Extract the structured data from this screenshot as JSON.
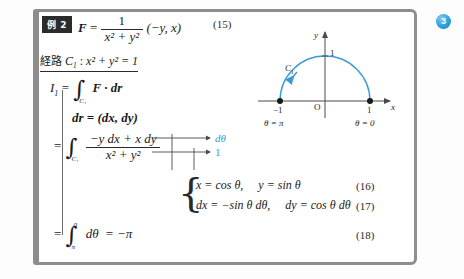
{
  "page": {
    "badge_number": "3",
    "accent_blue": "#2f9fe0",
    "frame_color": "#8d8d8d"
  },
  "example": {
    "badge_label": "例 2",
    "field_lhs": "F",
    "field_eq": "=",
    "field_frac_num": "1",
    "field_frac_den": "x² + y²",
    "field_vector": "(−y, x)",
    "eqnum": "(15)"
  },
  "path": {
    "label": "経路",
    "curve_name": "C",
    "curve_sub": "1",
    "colon": ":",
    "equation": "x² + y² = 1"
  },
  "derivation": {
    "lhs": "I",
    "lhs_sub": "1",
    "eq1": "=",
    "int1_sub": "C₁",
    "integrand1": "F · dr",
    "step_dr": "dr = (dx, dy)",
    "eq2": "=",
    "int2_sub": "C₁",
    "frac_num": "−y dx + x dy",
    "frac_den": "x² + y²",
    "eq3": "=",
    "int3_lower": "π",
    "int3_upper": "0",
    "integrand3": "dθ",
    "result": "= −π",
    "eqnum_final": "(18)"
  },
  "annotations": {
    "top_label": "dθ",
    "bottom_label": "1"
  },
  "substitutions": {
    "line1_a": "x = cos θ,",
    "line1_b": "y = sin θ",
    "eqnum1": "(16)",
    "line2_a": "dx = −sin θ dθ,",
    "line2_b": "dy = cos θ dθ",
    "eqnum2": "(17)"
  },
  "diagram": {
    "axis_y_label": "y",
    "axis_x_label": "x",
    "origin_label": "O",
    "y_tick_label": "1",
    "x_tick_left": "−1",
    "x_tick_right": "1",
    "curve_label": "C",
    "curve_label_sub": "1",
    "theta_left": "θ = π",
    "theta_right": "θ = 0",
    "curve_color": "#3a9bd9"
  }
}
